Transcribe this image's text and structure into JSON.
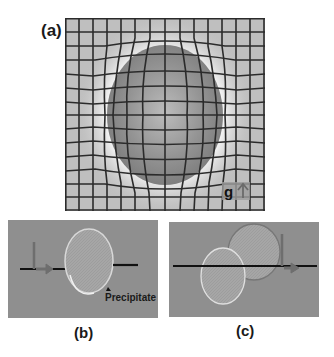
{
  "figure": {
    "panel_a": {
      "label": "(a)",
      "description": "Deformed square grid around an ellipsoidal droplet/precipitate",
      "gravity_label": "g",
      "gravity_icon": "arrow-up-icon",
      "colors": {
        "grid_bg": "#bdbdbd",
        "grid_line": "#2a2a2a",
        "ellipse": "#8a8a8a",
        "halo": "#f2f2f2"
      }
    },
    "panel_b": {
      "label": "(b)",
      "annotation": "Precipitate",
      "colors": {
        "background": "#8f8f8f",
        "disk": "#a9a9a9",
        "line": "#111111",
        "arrow": "#6e6e6e"
      }
    },
    "panel_c": {
      "label": "(c)",
      "colors": {
        "background": "#8f8f8f",
        "disk": "#a9a9a9",
        "line": "#111111",
        "arrow": "#6e6e6e"
      }
    }
  }
}
